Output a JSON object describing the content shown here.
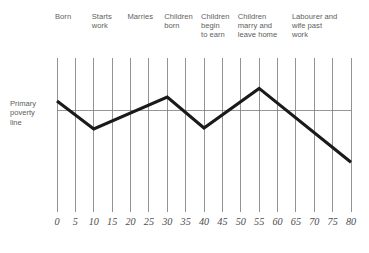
{
  "chart_data": {
    "type": "line",
    "title": "",
    "subtitle": "",
    "xlabel": "",
    "ylabel": "Primary poverty line",
    "xlim": [
      0,
      80
    ],
    "ylim": [
      -3.4,
      1.7
    ],
    "grid": true,
    "legend_position": "none",
    "x_tick_step": 5,
    "x_ticks": [
      0,
      5,
      10,
      15,
      20,
      25,
      30,
      35,
      40,
      45,
      50,
      55,
      60,
      65,
      70,
      75,
      80
    ],
    "x_tick_labels": [
      "0",
      "5",
      "10",
      "15",
      "20",
      "25",
      "30",
      "35",
      "40",
      "45",
      "50",
      "55",
      "60",
      "65",
      "70",
      "75",
      "80"
    ],
    "reference_lines": [
      {
        "name": "primary-poverty-line",
        "orientation": "horizontal",
        "value": 0,
        "label": "Primary poverty line"
      }
    ],
    "series": [
      {
        "name": "household-income-relative-to-poverty-line",
        "x": [
          0,
          10,
          30,
          40,
          55,
          80
        ],
        "values": [
          0.5,
          -1.05,
          0.72,
          -1.0,
          1.2,
          -2.9
        ]
      }
    ],
    "annotations": [
      {
        "id": "born",
        "x": 0,
        "text": "Born"
      },
      {
        "id": "starts-work",
        "x": 10,
        "text": "Starts\nwork"
      },
      {
        "id": "marries",
        "x": 20,
        "text": "Marries"
      },
      {
        "id": "children-born",
        "x": 30,
        "text": "Children\nborn"
      },
      {
        "id": "children-begin-to-earn",
        "x": 40,
        "text": "Children\nbegin\nto earn"
      },
      {
        "id": "children-marry-and-leave-home",
        "x": 50,
        "text": "Children\nmarry and\nleave home"
      },
      {
        "id": "labourer-and-wife-past-work",
        "x": 65,
        "text": "Labourer and\nwife past\nwork"
      }
    ],
    "colors": {
      "series": "#1a1a1a",
      "gridline": "#6e6f71",
      "poverty_line": "#7b7c7e",
      "text": "#5d5e60",
      "background": "#ffffff"
    }
  },
  "axis": {
    "y_label_text": "Primary\npoverty\nline"
  }
}
